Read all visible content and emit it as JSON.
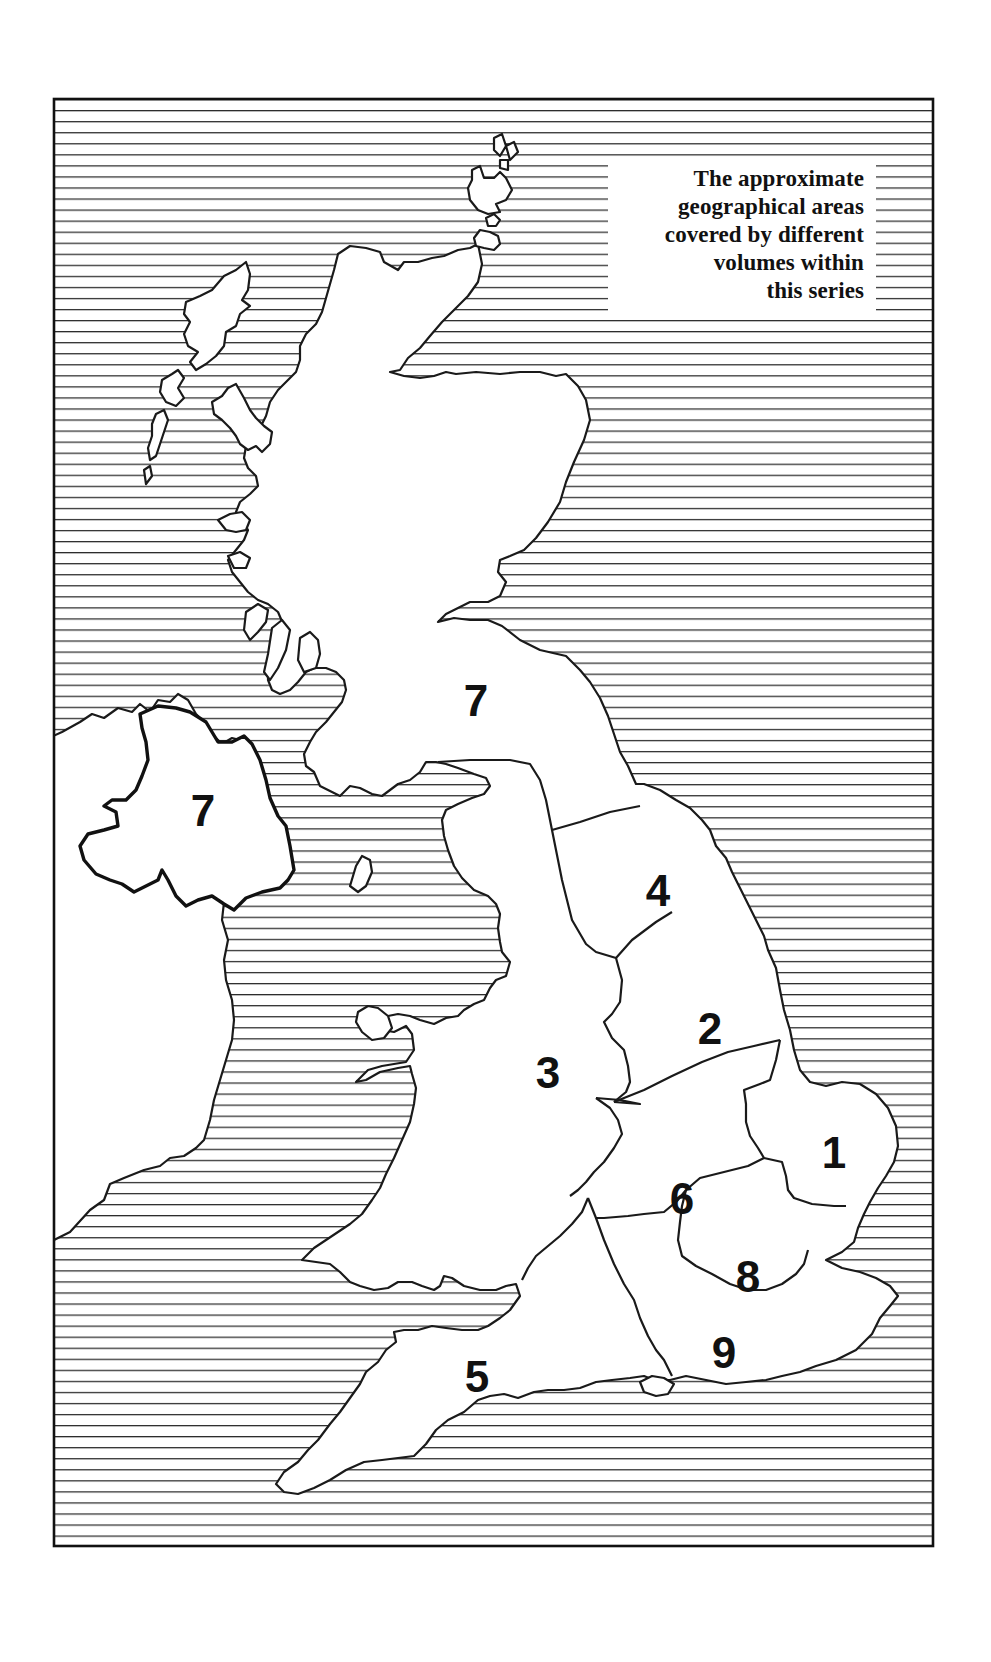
{
  "map": {
    "type": "regional coverage map",
    "frame": {
      "x": 54,
      "y": 99,
      "width": 879,
      "height": 1447
    },
    "sea_pattern": "horizontal-hatching",
    "colors": {
      "land": "#ffffff",
      "ink": "#111111",
      "sea_lines": "#2a2a2a"
    },
    "legend": {
      "lines": [
        "The approximate",
        "geographical areas",
        "covered by different",
        "volumes within",
        "this series"
      ]
    },
    "regions": [
      {
        "id": "7-scotland",
        "label": "7",
        "area": "Scotland and far north of England"
      },
      {
        "id": "7-northern-ireland",
        "label": "7",
        "area": "Northern Ireland"
      },
      {
        "id": "4",
        "label": "4",
        "area": "Yorkshire / North East"
      },
      {
        "id": "2",
        "label": "2",
        "area": "Lincolnshire / East Midlands"
      },
      {
        "id": "3",
        "label": "3",
        "area": "Wales and North West / West Midlands"
      },
      {
        "id": "1",
        "label": "1",
        "area": "East Anglia"
      },
      {
        "id": "6",
        "label": "6",
        "area": "South Midlands"
      },
      {
        "id": "8",
        "label": "8",
        "area": "London and Thames"
      },
      {
        "id": "9",
        "label": "9",
        "area": "South East"
      },
      {
        "id": "5",
        "label": "5",
        "area": "South West"
      }
    ]
  }
}
